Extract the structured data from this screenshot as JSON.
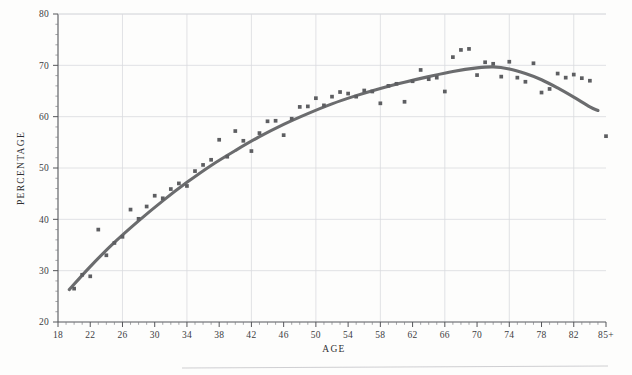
{
  "figure": {
    "background_color": "#fdfdfc",
    "curve_color": "#6b6c6e",
    "point_color": "#5d5e61",
    "grid_color": "#d9dade",
    "axis_color": "#55565a"
  },
  "axis_titles": {
    "x": "AGE",
    "y": "PERCENTAGE"
  },
  "chart_data": {
    "type": "scatter",
    "title": "",
    "subtitle": "",
    "xlabel": "AGE",
    "ylabel": "PERCENTAGE",
    "xlim": [
      18,
      86
    ],
    "ylim": [
      20,
      80
    ],
    "grid": true,
    "legend": null,
    "x_tick_labels": [
      "18",
      "22",
      "26",
      "30",
      "34",
      "38",
      "42",
      "46",
      "50",
      "54",
      "58",
      "62",
      "66",
      "70",
      "74",
      "78",
      "82",
      "85+"
    ],
    "x_tick_values": [
      18,
      22,
      26,
      30,
      34,
      38,
      42,
      46,
      50,
      54,
      58,
      62,
      66,
      70,
      74,
      78,
      82,
      86
    ],
    "x_minor_tick_step": 1,
    "y_tick_labels": [
      "20",
      "30",
      "40",
      "50",
      "60",
      "70",
      "80"
    ],
    "y_tick_values": [
      20,
      30,
      40,
      50,
      60,
      70,
      80
    ],
    "y_minor_tick_step": 2,
    "x_gridline_values": [
      26,
      34,
      42,
      50,
      58,
      66,
      74,
      82
    ],
    "y_gridline_values": [
      30,
      40,
      50,
      60,
      70,
      80
    ],
    "series": [
      {
        "name": "Observed percentage by age",
        "type": "scatter",
        "marker": "square",
        "points": [
          {
            "x": 20,
            "y": 26.5
          },
          {
            "x": 21,
            "y": 29.2
          },
          {
            "x": 22,
            "y": 28.9
          },
          {
            "x": 23,
            "y": 38.0
          },
          {
            "x": 24,
            "y": 33.0
          },
          {
            "x": 25,
            "y": 35.4
          },
          {
            "x": 26,
            "y": 36.6
          },
          {
            "x": 27,
            "y": 41.9
          },
          {
            "x": 28,
            "y": 40.1
          },
          {
            "x": 29,
            "y": 42.5
          },
          {
            "x": 30,
            "y": 44.6
          },
          {
            "x": 31,
            "y": 44.1
          },
          {
            "x": 32,
            "y": 45.9
          },
          {
            "x": 33,
            "y": 47.0
          },
          {
            "x": 34,
            "y": 46.5
          },
          {
            "x": 35,
            "y": 49.4
          },
          {
            "x": 36,
            "y": 50.6
          },
          {
            "x": 37,
            "y": 51.6
          },
          {
            "x": 38,
            "y": 55.5
          },
          {
            "x": 39,
            "y": 52.2
          },
          {
            "x": 40,
            "y": 57.2
          },
          {
            "x": 41,
            "y": 55.3
          },
          {
            "x": 42,
            "y": 53.3
          },
          {
            "x": 43,
            "y": 56.8
          },
          {
            "x": 44,
            "y": 59.1
          },
          {
            "x": 45,
            "y": 59.2
          },
          {
            "x": 46,
            "y": 56.4
          },
          {
            "x": 47,
            "y": 59.6
          },
          {
            "x": 48,
            "y": 61.9
          },
          {
            "x": 49,
            "y": 62.0
          },
          {
            "x": 50,
            "y": 63.6
          },
          {
            "x": 51,
            "y": 62.2
          },
          {
            "x": 52,
            "y": 63.9
          },
          {
            "x": 53,
            "y": 64.8
          },
          {
            "x": 54,
            "y": 64.5
          },
          {
            "x": 55,
            "y": 63.9
          },
          {
            "x": 56,
            "y": 65.1
          },
          {
            "x": 57,
            "y": 64.9
          },
          {
            "x": 58,
            "y": 62.6
          },
          {
            "x": 59,
            "y": 66.0
          },
          {
            "x": 60,
            "y": 66.4
          },
          {
            "x": 61,
            "y": 62.9
          },
          {
            "x": 62,
            "y": 66.9
          },
          {
            "x": 63,
            "y": 69.1
          },
          {
            "x": 64,
            "y": 67.3
          },
          {
            "x": 65,
            "y": 67.6
          },
          {
            "x": 66,
            "y": 64.9
          },
          {
            "x": 67,
            "y": 71.6
          },
          {
            "x": 68,
            "y": 73.0
          },
          {
            "x": 69,
            "y": 73.2
          },
          {
            "x": 70,
            "y": 68.1
          },
          {
            "x": 71,
            "y": 70.6
          },
          {
            "x": 72,
            "y": 70.3
          },
          {
            "x": 73,
            "y": 67.8
          },
          {
            "x": 74,
            "y": 70.7
          },
          {
            "x": 75,
            "y": 67.6
          },
          {
            "x": 76,
            "y": 66.8
          },
          {
            "x": 77,
            "y": 70.4
          },
          {
            "x": 78,
            "y": 64.7
          },
          {
            "x": 79,
            "y": 65.4
          },
          {
            "x": 80,
            "y": 68.4
          },
          {
            "x": 81,
            "y": 67.6
          },
          {
            "x": 82,
            "y": 68.2
          },
          {
            "x": 83,
            "y": 67.5
          },
          {
            "x": 84,
            "y": 67.0
          },
          {
            "x": 86,
            "y": 56.2
          }
        ]
      },
      {
        "name": "Fitted curve",
        "type": "line",
        "points": [
          {
            "x": 19.4,
            "y": 26.3
          },
          {
            "x": 22,
            "y": 30.8
          },
          {
            "x": 25,
            "y": 35.5
          },
          {
            "x": 28,
            "y": 39.7
          },
          {
            "x": 31,
            "y": 43.6
          },
          {
            "x": 34,
            "y": 47.2
          },
          {
            "x": 37,
            "y": 50.5
          },
          {
            "x": 40,
            "y": 53.4
          },
          {
            "x": 43,
            "y": 56.1
          },
          {
            "x": 46,
            "y": 58.5
          },
          {
            "x": 49,
            "y": 60.6
          },
          {
            "x": 52,
            "y": 62.5
          },
          {
            "x": 55,
            "y": 64.1
          },
          {
            "x": 58,
            "y": 65.5
          },
          {
            "x": 61,
            "y": 66.7
          },
          {
            "x": 64,
            "y": 67.8
          },
          {
            "x": 67,
            "y": 68.8
          },
          {
            "x": 70,
            "y": 69.5
          },
          {
            "x": 72,
            "y": 69.7
          },
          {
            "x": 74,
            "y": 69.3
          },
          {
            "x": 76,
            "y": 68.4
          },
          {
            "x": 78,
            "y": 67.2
          },
          {
            "x": 80,
            "y": 65.6
          },
          {
            "x": 82,
            "y": 63.8
          },
          {
            "x": 84,
            "y": 61.9
          },
          {
            "x": 85,
            "y": 61.2
          }
        ]
      }
    ]
  }
}
